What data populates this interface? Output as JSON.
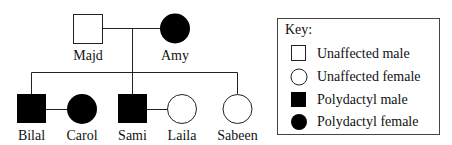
{
  "diagram": {
    "type": "pedigree",
    "colors": {
      "stroke": "#111111",
      "affected": "#000000",
      "unaffected": "#ffffff"
    },
    "generation1": [
      {
        "name": "Majd",
        "sex": "male",
        "status": "unaffected"
      },
      {
        "name": "Amy",
        "sex": "female",
        "status": "polydactyl"
      }
    ],
    "generation2": [
      {
        "name": "Bilal",
        "sex": "male",
        "status": "polydactyl",
        "child_of_gen1": true
      },
      {
        "name": "Carol",
        "sex": "female",
        "status": "polydactyl",
        "spouse_of": "Bilal"
      },
      {
        "name": "Sami",
        "sex": "male",
        "status": "polydactyl",
        "child_of_gen1": true
      },
      {
        "name": "Laila",
        "sex": "female",
        "status": "unaffected",
        "spouse_of": "Sami"
      },
      {
        "name": "Sabeen",
        "sex": "female",
        "status": "unaffected",
        "child_of_gen1": true
      }
    ]
  },
  "key": {
    "title": "Key:",
    "items": [
      {
        "symbol": "open-square",
        "label": "Unaffected male"
      },
      {
        "symbol": "open-circle",
        "label": "Unaffected female"
      },
      {
        "symbol": "filled-square",
        "label": "Polydactyl male"
      },
      {
        "symbol": "filled-circle",
        "label": "Polydactyl female"
      }
    ]
  }
}
